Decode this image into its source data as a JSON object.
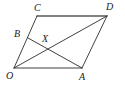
{
  "figure": {
    "type": "geometry-diagram",
    "background_color": "#ffffff",
    "stroke_color": "#2b2b2b",
    "label_color": "#1a1a1a",
    "points": {
      "O": {
        "label": "O",
        "x": 14,
        "y": 68,
        "label_x": 6,
        "label_y": 71
      },
      "A": {
        "label": "A",
        "x": 82,
        "y": 68,
        "label_x": 79,
        "label_y": 72
      },
      "D": {
        "label": "D",
        "x": 107,
        "y": 16,
        "label_x": 106,
        "label_y": 2
      },
      "C": {
        "label": "C",
        "x": 37,
        "y": 16,
        "label_x": 34,
        "label_y": 3
      },
      "B": {
        "label": "B",
        "x": 28,
        "y": 38,
        "label_x": 14,
        "label_y": 29
      },
      "X": {
        "label": "X",
        "x": 48,
        "y": 46,
        "label_x": 42,
        "label_y": 34
      }
    },
    "segments": [
      {
        "name": "segment-O-A",
        "from": "O",
        "to": "A",
        "style": "thin"
      },
      {
        "name": "segment-A-D",
        "from": "A",
        "to": "D",
        "style": "thin"
      },
      {
        "name": "segment-C-D",
        "from": "C",
        "to": "D",
        "style": "thick"
      },
      {
        "name": "segment-O-C",
        "from": "O",
        "to": "C",
        "style": "thin"
      },
      {
        "name": "segment-O-D",
        "from": "O",
        "to": "D",
        "style": "thin"
      },
      {
        "name": "segment-B-A",
        "from": "B",
        "to": "A",
        "style": "thin"
      }
    ]
  }
}
